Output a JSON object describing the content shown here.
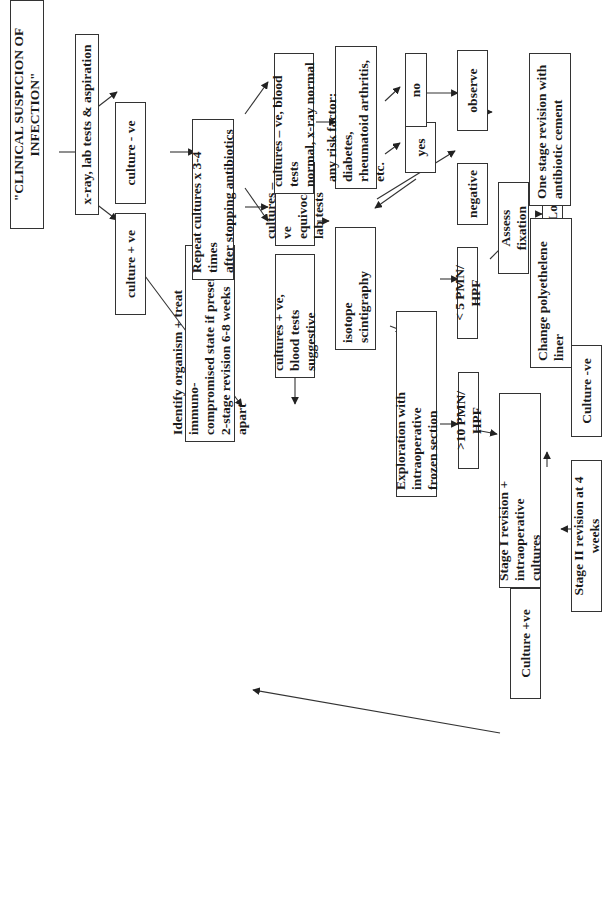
{
  "nodes": {
    "start": "\"CLINICAL SUSPICION OF INFECTION\"",
    "xray": "x-ray, lab tests & aspiration",
    "culture_pos": "culture  +  ve",
    "culture_neg": "culture  -  ve",
    "identify": "Identify organism + treat immuno-\ncompromised state if present;\n2-stage  revision 6-8 weeks apart",
    "repeat": "Repeat cultures  x  3-4 times\nafter stopping antibiotics",
    "cultures_pos_blood": "cultures + ve,\nblood tests suggestive",
    "cultures_neg_equivocal": "cultures  –  ve\nequivocal lab tests",
    "cultures_neg_normal": "cultures  – ve, blood tests\nnormal, x-ray normal",
    "risk_factor": "any risk factor: diabetes,\nrheumatoid arthritis, etc.",
    "yes": "yes",
    "no": "no",
    "isotope": "isotope scintigraphy",
    "positive": "positive",
    "negative": "negative",
    "observe": "observe",
    "exploration": "Exploration with intraoperative\nfrozen section",
    "gt10": ">10  PMN/ HPF",
    "lt5": "< 5 PMN/ HPF",
    "stage1": "Stage I revision + intraoperative\ncultures",
    "culture_pos2": "Culture +ve",
    "culture_neg2": "Culture -ve",
    "stage2": "Stage II revision at 4 weeks",
    "assess": "Assess fixation",
    "solid": "Solid",
    "loose": "Loose",
    "change_liner": "Change polyethelene\nliner",
    "one_stage": "One stage revision with\nantibiotic cement"
  },
  "edges": [
    [
      "start",
      "xray"
    ],
    [
      "xray",
      "culture_pos"
    ],
    [
      "xray",
      "culture_neg"
    ],
    [
      "culture_pos",
      "identify"
    ],
    [
      "culture_neg",
      "repeat"
    ],
    [
      "repeat",
      "cultures_pos_blood"
    ],
    [
      "repeat",
      "cultures_neg_equivocal"
    ],
    [
      "repeat",
      "cultures_neg_normal"
    ],
    [
      "cultures_pos_blood",
      "identify"
    ],
    [
      "cultures_neg_equivocal",
      "isotope"
    ],
    [
      "cultures_neg_normal",
      "risk_factor"
    ],
    [
      "risk_factor",
      "yes"
    ],
    [
      "risk_factor",
      "no"
    ],
    [
      "yes",
      "isotope"
    ],
    [
      "no",
      "observe"
    ],
    [
      "isotope",
      "positive"
    ],
    [
      "isotope",
      "negative"
    ],
    [
      "negative",
      "observe"
    ],
    [
      "positive",
      "exploration"
    ],
    [
      "exploration",
      "gt10"
    ],
    [
      "exploration",
      "lt5"
    ],
    [
      "gt10",
      "stage1"
    ],
    [
      "stage1",
      "culture_pos2"
    ],
    [
      "stage1",
      "culture_neg2"
    ],
    [
      "culture_pos2",
      "identify"
    ],
    [
      "culture_neg2",
      "stage2"
    ],
    [
      "lt5",
      "assess"
    ],
    [
      "assess",
      "solid"
    ],
    [
      "assess",
      "loose"
    ],
    [
      "solid",
      "change_liner"
    ],
    [
      "loose",
      "one_stage"
    ]
  ],
  "colors": {
    "line": "#333333",
    "text": "#1a1a1a",
    "background": "#ffffff"
  }
}
